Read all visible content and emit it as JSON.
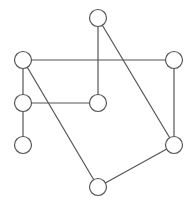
{
  "diagram": {
    "type": "graph",
    "width": 191,
    "height": 205,
    "colors": {
      "stroke": "#555555",
      "node_fill": "#ffffff",
      "background": "#ffffff"
    },
    "node_radius": 8.5,
    "nodes": [
      {
        "id": "A",
        "x": 98,
        "y": 18,
        "label": ""
      },
      {
        "id": "B",
        "x": 23,
        "y": 60,
        "label": ""
      },
      {
        "id": "C",
        "x": 174,
        "y": 60,
        "label": ""
      },
      {
        "id": "D",
        "x": 23,
        "y": 103,
        "label": ""
      },
      {
        "id": "E",
        "x": 98,
        "y": 103,
        "label": ""
      },
      {
        "id": "F",
        "x": 23,
        "y": 145,
        "label": ""
      },
      {
        "id": "G",
        "x": 174,
        "y": 145,
        "label": ""
      },
      {
        "id": "H",
        "x": 98,
        "y": 187,
        "label": ""
      }
    ],
    "edges": [
      {
        "from": "A",
        "to": "E"
      },
      {
        "from": "A",
        "to": "G"
      },
      {
        "from": "B",
        "to": "C"
      },
      {
        "from": "B",
        "to": "D"
      },
      {
        "from": "B",
        "to": "H"
      },
      {
        "from": "C",
        "to": "G"
      },
      {
        "from": "D",
        "to": "E"
      },
      {
        "from": "D",
        "to": "F"
      },
      {
        "from": "G",
        "to": "H"
      }
    ]
  }
}
